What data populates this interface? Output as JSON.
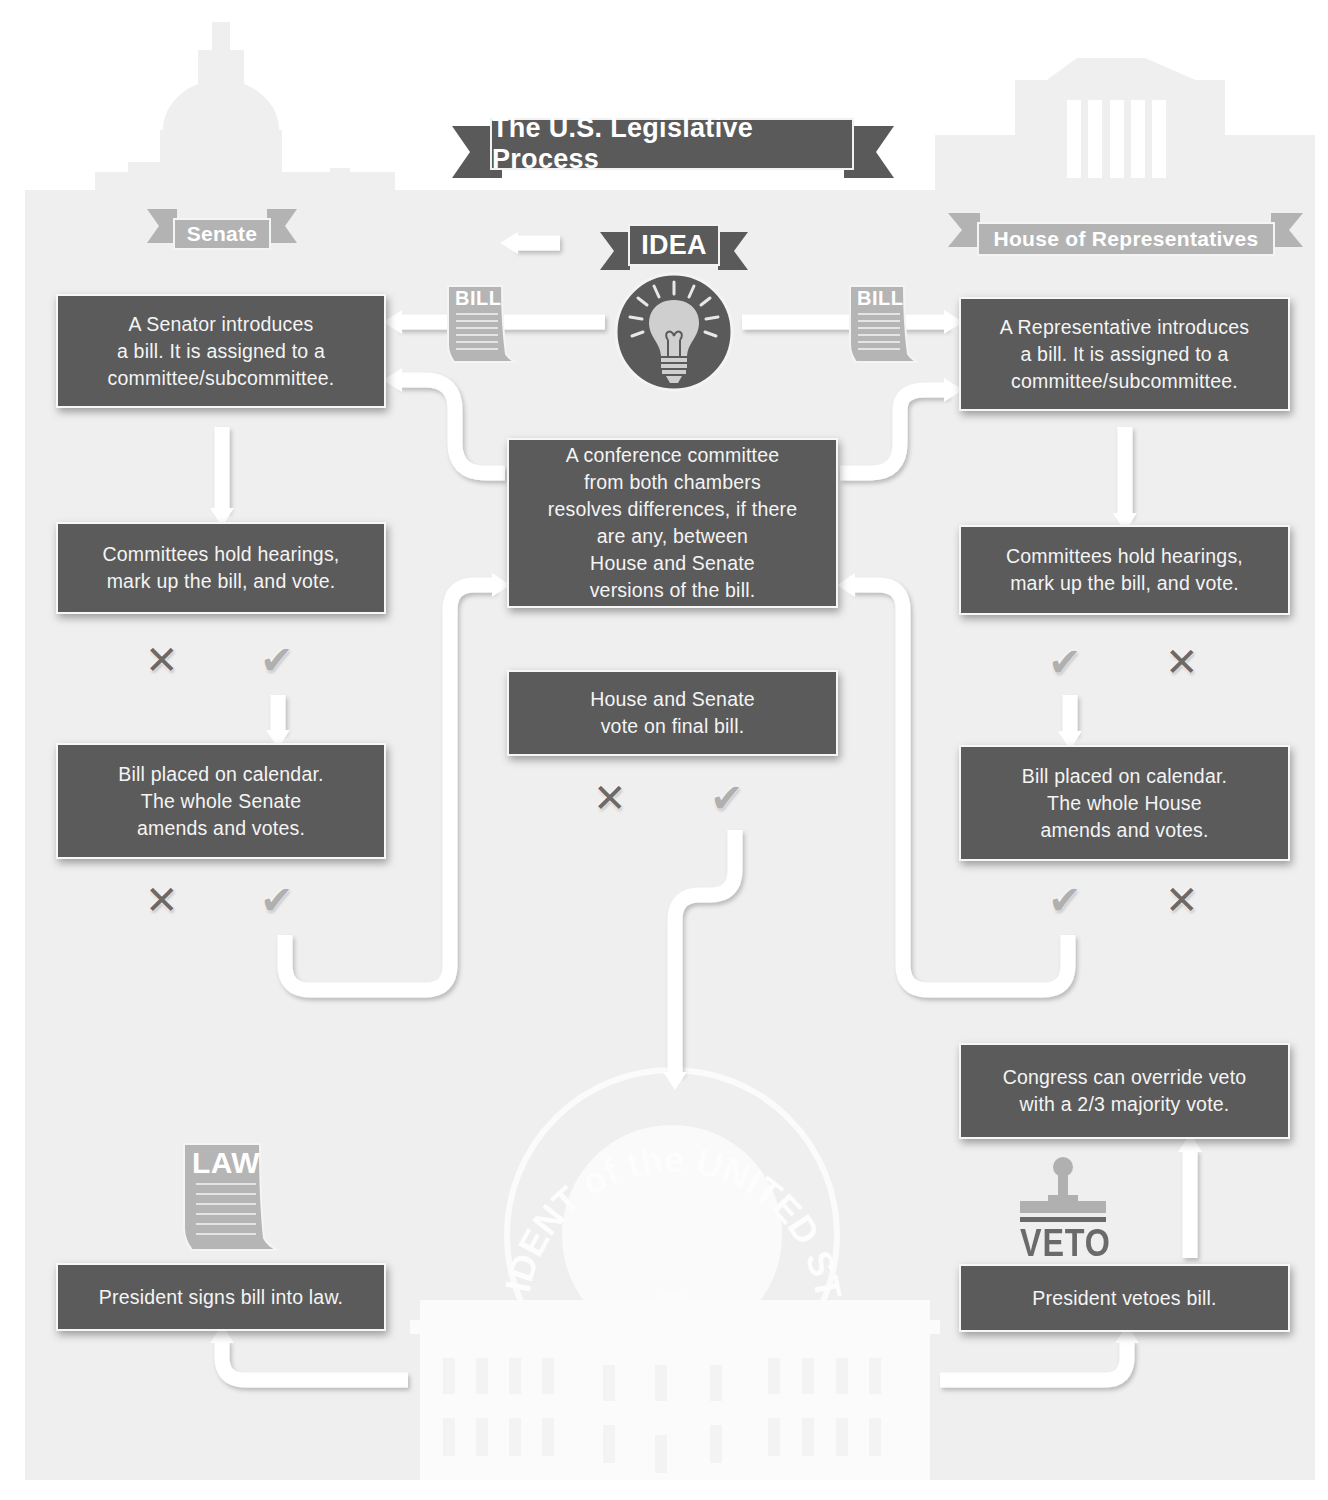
{
  "title": "The U.S. Legislative Process",
  "colors": {
    "box_fill": "#5b5b5b",
    "box_text": "#f4f4f4",
    "ribbon_dark": "#5a5a5a",
    "ribbon_light": "#b3b3b3",
    "background_building": "#f0f0f0",
    "arrow": "#ffffff",
    "x_mark": "#6a6a6a",
    "check_mark": "#b0b0b0"
  },
  "chambers": {
    "senate": {
      "label": "Senate"
    },
    "house": {
      "label": "House of Representatives"
    }
  },
  "idea": {
    "label": "IDEA",
    "icon": "lightbulb-icon"
  },
  "documents": {
    "bill_left": "BILL",
    "bill_right": "BILL",
    "law": "LAW",
    "veto": "VETO"
  },
  "seal": {
    "text": "PRESIDENT of the UNITED STATES"
  },
  "senate_steps": [
    {
      "text": "A Senator introduces\na bill. It is assigned to a\ncommittee/subcommittee."
    },
    {
      "text": "Committees hold hearings,\nmark up the bill, and vote."
    },
    {
      "text": "Bill placed on calendar.\nThe whole Senate\namends and votes."
    }
  ],
  "house_steps": [
    {
      "text": "A Representative introduces\na bill. It is assigned to a\ncommittee/subcommittee."
    },
    {
      "text": "Committees hold hearings,\nmark up the bill, and vote."
    },
    {
      "text": "Bill placed on calendar.\nThe whole House\namends and votes."
    }
  ],
  "center_steps": [
    {
      "text": "A conference committee\nfrom both chambers\nresolves differences, if there\nare any, between\nHouse and Senate\nversions of the bill."
    },
    {
      "text": "House and Senate\nvote on final bill."
    }
  ],
  "outcomes": {
    "sign": {
      "text": "President signs bill into law."
    },
    "veto": {
      "text": "President vetoes bill."
    },
    "override": {
      "text": "Congress can override veto\nwith a 2/3 majority vote."
    }
  },
  "marks": {
    "x": "✕",
    "check": "✔"
  }
}
